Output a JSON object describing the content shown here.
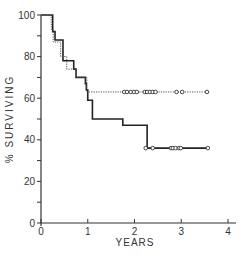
{
  "chart_data": {
    "type": "line",
    "subtype": "kaplan-meier-step",
    "title": "",
    "xlabel": "YEARS",
    "ylabel": "% SURVIVING",
    "xlim": [
      0,
      4
    ],
    "ylim": [
      0,
      100
    ],
    "x_ticks": [
      0,
      1,
      2,
      3,
      4
    ],
    "y_ticks": [
      0,
      20,
      40,
      60,
      80,
      100
    ],
    "grid": false,
    "legend": null,
    "series": [
      {
        "name": "solid",
        "style": "solid",
        "steps": [
          [
            0,
            100
          ],
          [
            0.25,
            92
          ],
          [
            0.3,
            88
          ],
          [
            0.47,
            78
          ],
          [
            0.7,
            74
          ],
          [
            0.75,
            70
          ],
          [
            0.95,
            67
          ],
          [
            0.97,
            64
          ],
          [
            1.0,
            59
          ],
          [
            1.1,
            50
          ],
          [
            1.75,
            47
          ],
          [
            2.27,
            36
          ],
          [
            3.55,
            36
          ]
        ],
        "censored": [
          2.24,
          2.39,
          2.78,
          2.82,
          2.88,
          2.95,
          2.99,
          3.57
        ]
      },
      {
        "name": "dotted",
        "style": "dotted",
        "steps": [
          [
            0,
            100
          ],
          [
            0.22,
            93
          ],
          [
            0.26,
            87
          ],
          [
            0.42,
            80
          ],
          [
            0.55,
            74
          ],
          [
            0.75,
            70
          ],
          [
            0.98,
            63
          ],
          [
            3.55,
            63
          ]
        ],
        "censored": [
          1.78,
          1.84,
          1.92,
          1.99,
          2.05,
          2.22,
          2.27,
          2.33,
          2.39,
          2.45,
          2.9,
          3.02,
          3.55
        ]
      }
    ]
  }
}
